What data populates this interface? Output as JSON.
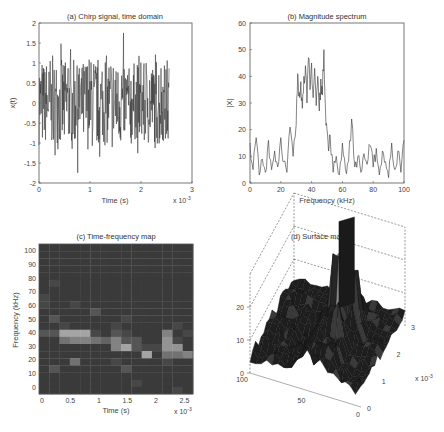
{
  "figure": {
    "width": 444,
    "height": 432
  },
  "chart_data": [
    {
      "id": "a",
      "type": "line",
      "title": "(a) Chirp signal, time domain",
      "xlabel": "Time (s)",
      "ylabel": "x(t)",
      "x_multiplier": "x 10^-3",
      "xlim": [
        0,
        3
      ],
      "ylim": [
        -2,
        2
      ],
      "xticks": [
        "0",
        "1",
        "2",
        "3"
      ],
      "yticks": [
        "-2",
        "-1.5",
        "-1",
        "-0.5",
        "0",
        "0.5",
        "1",
        "1.5",
        "2"
      ],
      "grid": false,
      "description": "Noisy chirp signal sampled from t=0 to ~2.55e-3 s, amplitude mostly within ±1.2 with spikes to ~1.9 and ~-1.9",
      "signal_end": 2.55,
      "approx_envelope": {
        "max": 1.9,
        "min": -1.93
      },
      "line_color": "#333333"
    },
    {
      "id": "b",
      "type": "line",
      "title": "(b) Magnitude spectrum",
      "xlabel": "Frequency (kHz)",
      "ylabel": "|X|",
      "xlim": [
        0,
        100
      ],
      "ylim": [
        0,
        60
      ],
      "xticks": [
        "0",
        "20",
        "40",
        "60",
        "80",
        "100"
      ],
      "yticks": [
        "0",
        "10",
        "20",
        "30",
        "40",
        "50",
        "60"
      ],
      "grid": false,
      "x": [
        0,
        2,
        4,
        6,
        8,
        10,
        12,
        14,
        16,
        18,
        20,
        22,
        24,
        26,
        28,
        30,
        31,
        32,
        33,
        34,
        35,
        36,
        37,
        38,
        39,
        40,
        41,
        42,
        43,
        44,
        45,
        46,
        47,
        48,
        49,
        50,
        51,
        52,
        54,
        56,
        58,
        60,
        62,
        64,
        66,
        68,
        70,
        72,
        74,
        76,
        78,
        80,
        82,
        84,
        86,
        88,
        90,
        92,
        94,
        96,
        98,
        100
      ],
      "values": [
        15,
        5,
        17,
        3,
        9,
        4,
        16,
        5,
        12,
        6,
        17,
        8,
        4,
        21,
        10,
        22,
        41,
        34,
        38,
        28,
        40,
        44,
        30,
        47,
        35,
        45,
        32,
        43,
        29,
        40,
        27,
        39,
        33,
        50,
        28,
        20,
        12,
        18,
        4,
        10,
        3,
        15,
        5,
        8,
        24,
        6,
        10,
        4,
        11,
        7,
        14,
        6,
        13,
        3,
        12,
        8,
        2,
        15,
        5,
        12,
        4,
        16
      ],
      "peak": {
        "x": 48,
        "y": 50
      },
      "secondary_peak": {
        "x": 66,
        "y": 24
      },
      "line_color": "#333333"
    },
    {
      "id": "c",
      "type": "heatmap",
      "title": "(c) Time-frequency map",
      "xlabel": "Time (s)",
      "ylabel": "Frequency (kHz)",
      "x_multiplier": "x 10^-3",
      "xlim": [
        -0.05,
        2.65
      ],
      "ylim": [
        -5,
        105
      ],
      "xticks": [
        "0",
        "0.5",
        "1",
        "1.5",
        "2",
        "2.5"
      ],
      "yticks": [
        "0",
        "10",
        "20",
        "30",
        "40",
        "50",
        "60",
        "70",
        "80",
        "90",
        "100"
      ],
      "cols": 15,
      "rows": 21,
      "row_note": "rows listed top (highest frequency) to bottom (lowest); values 0-9 intensity",
      "cells": [
        "111111111111111",
        "111111111111111",
        "111111111111111",
        "111111111111111",
        "111111111111111",
        "121111111111111",
        "111111111111111",
        "211111111111111",
        "211211111111111",
        "111113111111111",
        "131111112111111",
        "112111121111121",
        "338882132111612",
        "115665463311721",
        "111111168322771",
        "111111111181556",
        "111511121111211",
        "131111113111111",
        "111111111111111",
        "111111111211111",
        "111111111111121"
      ],
      "colormap": [
        "#2c2c2c",
        "#3a3a3a",
        "#474747",
        "#555555",
        "#636363",
        "#727272",
        "#828282",
        "#939393",
        "#a4a4a4",
        "#b5b5b5"
      ]
    },
    {
      "id": "d",
      "type": "surface",
      "title": "(d) Surface map",
      "zticks": [
        "0",
        "10",
        "20"
      ],
      "freq_ticks": [
        "100",
        "50",
        "0"
      ],
      "time_ticks": [
        "0",
        "1",
        "2",
        "3"
      ],
      "time_multiplier": "x 10^-3",
      "zlim": [
        0,
        30
      ],
      "description": "3D surface of time-frequency map viewed from an oblique angle; dark mesh with a tall spike near time ~2e-3 s, frequency ~40 kHz",
      "surface_color": "#1e1e1e"
    }
  ],
  "labels": {
    "a": {
      "title": "(a) Chirp signal, time domain",
      "xlabel": "Time (s)",
      "ylabel": "x(t)",
      "mult": "x 10",
      "mult_exp": "-3"
    },
    "b": {
      "title": "(b) Magnitude spectrum",
      "xlabel": "Frequency (kHz)",
      "ylabel": "|X|"
    },
    "c": {
      "title": "(c) Time-frequency map",
      "xlabel": "Time (s)",
      "ylabel": "Frequency (kHz)",
      "mult": "x 10",
      "mult_exp": "-3"
    },
    "d": {
      "title": "(d) Surface map",
      "mult": "x 10",
      "mult_exp": "-3"
    }
  }
}
